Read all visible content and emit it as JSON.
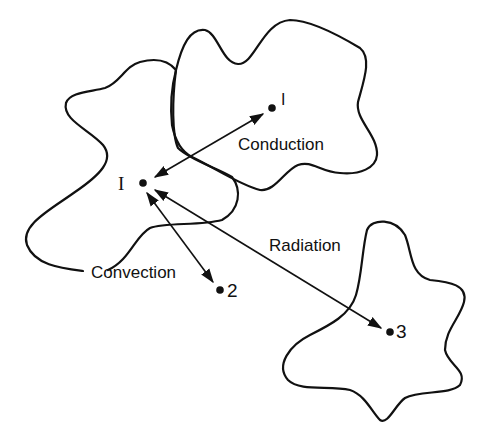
{
  "diagram": {
    "type": "heat-transfer-modes",
    "nodes": [
      {
        "id": "I",
        "label": "I",
        "x": 143,
        "y": 183
      },
      {
        "id": "1",
        "label": "1",
        "x": 272,
        "y": 107
      },
      {
        "id": "2",
        "label": "2",
        "x": 220,
        "y": 290
      },
      {
        "id": "3",
        "label": "3",
        "x": 390,
        "y": 332
      }
    ],
    "edges": [
      {
        "from": "I",
        "to": "1",
        "label": "Conduction",
        "direction": "bidirectional"
      },
      {
        "from": "I",
        "to": "2",
        "label": "Convection",
        "direction": "bidirectional"
      },
      {
        "from": "I",
        "to": "3",
        "label": "Radiation",
        "direction": "bidirectional"
      }
    ],
    "labels": {
      "conduction": "Conduction",
      "convection": "Convection",
      "radiation": "Radiation",
      "node_I": "I",
      "node_1": "I",
      "node_2": "2",
      "node_3": "3"
    },
    "colors": {
      "line": "#111111",
      "background": "#ffffff"
    }
  }
}
